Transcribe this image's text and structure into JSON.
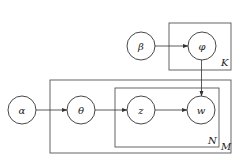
{
  "diagram": {
    "type": "plate-notation",
    "nodes": [
      {
        "id": "alpha",
        "label": "α",
        "cx": 22,
        "cy": 110,
        "r": 14
      },
      {
        "id": "theta",
        "label": "θ",
        "cx": 81,
        "cy": 110,
        "r": 14
      },
      {
        "id": "z",
        "label": "z",
        "cx": 141,
        "cy": 110,
        "r": 14
      },
      {
        "id": "w",
        "label": "w",
        "cx": 201,
        "cy": 110,
        "r": 14
      },
      {
        "id": "beta",
        "label": "β",
        "cx": 141,
        "cy": 46,
        "r": 14
      },
      {
        "id": "phi",
        "label": "φ",
        "cx": 202,
        "cy": 46,
        "r": 14
      }
    ],
    "plates": [
      {
        "id": "K",
        "label": "K",
        "x": 169,
        "y": 23,
        "w": 62,
        "h": 47
      },
      {
        "id": "M",
        "label": "M",
        "x": 50,
        "y": 80,
        "w": 181,
        "h": 73
      },
      {
        "id": "N",
        "label": "N",
        "x": 115,
        "y": 88,
        "w": 104,
        "h": 59
      }
    ],
    "edges": [
      {
        "from": "alpha",
        "to": "theta"
      },
      {
        "from": "theta",
        "to": "z"
      },
      {
        "from": "z",
        "to": "w"
      },
      {
        "from": "beta",
        "to": "phi"
      },
      {
        "from": "phi",
        "to": "w"
      }
    ]
  }
}
